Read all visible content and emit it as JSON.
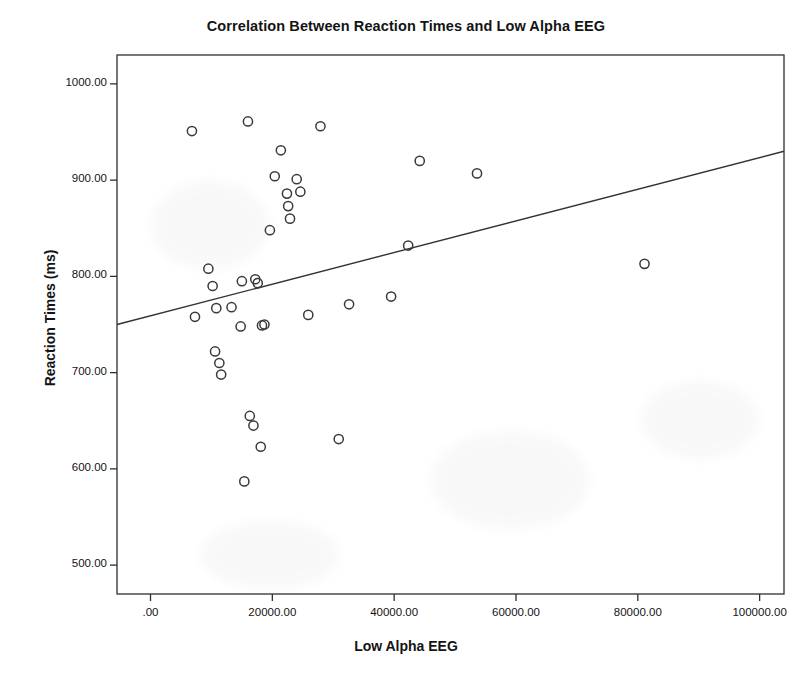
{
  "chart_data": {
    "type": "scatter",
    "title": "Correlation Between Reaction Times and Low Alpha EEG",
    "xlabel": "Low Alpha EEG",
    "ylabel": "Reaction Times (ms)",
    "xlim": [
      -5500,
      104000
    ],
    "ylim": [
      470,
      1030
    ],
    "grid": false,
    "legend": null,
    "xticks": [
      0,
      20000,
      40000,
      60000,
      80000,
      100000
    ],
    "xtick_labels": [
      ".00",
      "20000.00",
      "40000.00",
      "60000.00",
      "80000.00",
      "100000.00"
    ],
    "yticks": [
      500,
      600,
      700,
      800,
      900,
      1000
    ],
    "ytick_labels": [
      "500.00",
      "600.00",
      "700.00",
      "800.00",
      "900.00",
      "1000.00"
    ],
    "marker": "open-circle",
    "marker_color": "#3a3a3a",
    "series": [
      {
        "name": "Participants",
        "points": [
          [
            6800,
            951
          ],
          [
            7300,
            758
          ],
          [
            9500,
            808
          ],
          [
            10200,
            790
          ],
          [
            10600,
            722
          ],
          [
            10800,
            767
          ],
          [
            11300,
            710
          ],
          [
            11600,
            698
          ],
          [
            13300,
            768
          ],
          [
            14800,
            748
          ],
          [
            15000,
            795
          ],
          [
            15400,
            587
          ],
          [
            16000,
            961
          ],
          [
            16300,
            655
          ],
          [
            16900,
            645
          ],
          [
            17200,
            797
          ],
          [
            17600,
            793
          ],
          [
            18100,
            623
          ],
          [
            18300,
            749
          ],
          [
            18700,
            750
          ],
          [
            19600,
            848
          ],
          [
            20400,
            904
          ],
          [
            21400,
            931
          ],
          [
            22400,
            886
          ],
          [
            22600,
            873
          ],
          [
            22900,
            860
          ],
          [
            24000,
            901
          ],
          [
            24600,
            888
          ],
          [
            25900,
            760
          ],
          [
            27900,
            956
          ],
          [
            30900,
            631
          ],
          [
            32600,
            771
          ],
          [
            39500,
            779
          ],
          [
            42300,
            832
          ],
          [
            44200,
            920
          ],
          [
            53600,
            907
          ],
          [
            81100,
            813
          ]
        ]
      }
    ],
    "trendline": {
      "name": "Linear fit",
      "x_start": -5500,
      "y_start": 750,
      "x_end": 104000,
      "y_end": 930,
      "color": "#333333"
    }
  },
  "axes": {
    "title": "Correlation Between Reaction Times and Low Alpha EEG",
    "x_title": "Low Alpha EEG",
    "y_title": "Reaction Times (ms)"
  }
}
